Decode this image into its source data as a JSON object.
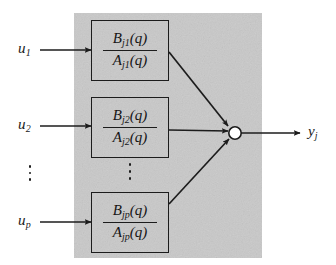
{
  "figure": {
    "type": "block-diagram",
    "panel": {
      "fill_color": "#c9c9c9",
      "x": 74,
      "y": 13,
      "width": 188,
      "height": 245
    },
    "line_color": "#1c1c1c",
    "background_color": "#ffffff"
  },
  "inputs": [
    {
      "id": "u1",
      "base": "u",
      "sub": "1",
      "arrow_label": "input-arrow-1"
    },
    {
      "id": "u2",
      "base": "u",
      "sub": "2",
      "arrow_label": "input-arrow-2"
    },
    {
      "id": "up",
      "base": "u",
      "sub": "p",
      "arrow_label": "input-arrow-p"
    }
  ],
  "blocks": [
    {
      "id": "block-1",
      "numerator": {
        "base": "B",
        "sub": "j1",
        "arg": "(q)"
      },
      "denominator": {
        "base": "A",
        "sub": "j1",
        "arg": "(q)"
      },
      "numerator_text": "B j1 (q)",
      "denominator_text": "A j1 (q)"
    },
    {
      "id": "block-2",
      "numerator": {
        "base": "B",
        "sub": "j2",
        "arg": "(q)"
      },
      "denominator": {
        "base": "A",
        "sub": "j2",
        "arg": "(q)"
      },
      "numerator_text": "B j2 (q)",
      "denominator_text": "A j2 (q)"
    },
    {
      "id": "block-p",
      "numerator": {
        "base": "B",
        "sub": "jp",
        "arg": "(q)"
      },
      "denominator": {
        "base": "A",
        "sub": "jp",
        "arg": "(q)"
      },
      "numerator_text": "B jp (q)",
      "denominator_text": "A jp (q)"
    }
  ],
  "ellipses": [
    {
      "id": "input-ellipsis",
      "glyph": "vertical-ellipsis",
      "dots": 3
    },
    {
      "id": "block-ellipsis",
      "glyph": "vertical-ellipsis",
      "dots": 3
    }
  ],
  "summing_node": {
    "id": "summing-node",
    "shape": "open-circle",
    "incoming": 3,
    "outgoing": 1
  },
  "output": {
    "id": "yj",
    "base": "y",
    "sub": "j"
  }
}
